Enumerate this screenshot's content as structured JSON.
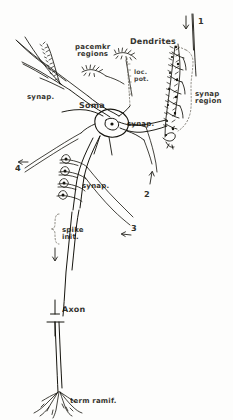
{
  "figure": {
    "ink_color": "#15140e",
    "background_color": "#fdfdfc",
    "dotted_color": "#6d6a60"
  },
  "labels": {
    "dendrites": "Dendrites",
    "pacemkr_regions": "pacemkr\nregions",
    "loc_pot": "loc.\npot.",
    "synap_left": "synap.",
    "soma": "Soma",
    "synap_soma": "synap.",
    "synap_region": "synap\nregion",
    "synap_axon": "synap.",
    "spike_init": "spike\ninit.",
    "axon": "Axon",
    "term_ramif": "term ramif."
  },
  "markers": {
    "one": "1",
    "two": "2",
    "three": "3",
    "four": "4"
  },
  "icons": {
    "arrow_down_top": "arrow-down-icon",
    "arrow_left_four": "arrow-left-icon",
    "arrow_up_two": "arrow-up-icon",
    "arrow_left_three": "arrow-left-icon",
    "arrow_down_axon": "arrow-down-icon",
    "brace_spike_init": "curly-brace-icon",
    "dotted_bracket_loc_pot": "dotted-line-icon",
    "dotted_bracket_synap_region": "dotted-outline-icon"
  }
}
